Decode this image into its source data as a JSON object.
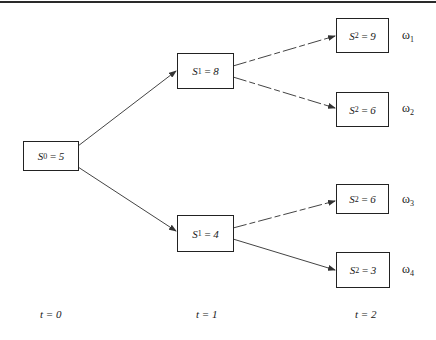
{
  "diagram": {
    "type": "binomial-tree",
    "nodes": [
      {
        "id": "s0",
        "var": "S",
        "sub": "0",
        "eq": " = ",
        "value": "5"
      },
      {
        "id": "s1_up",
        "var": "S",
        "sub": "1",
        "eq": " = ",
        "value": "8"
      },
      {
        "id": "s1_dn",
        "var": "S",
        "sub": "1",
        "eq": " = ",
        "value": "4"
      },
      {
        "id": "s2_uu",
        "var": "S",
        "sub": "2",
        "eq": " = ",
        "value": "9"
      },
      {
        "id": "s2_ud",
        "var": "S",
        "sub": "2",
        "eq": " = ",
        "value": "6"
      },
      {
        "id": "s2_du",
        "var": "S",
        "sub": "2",
        "eq": " = ",
        "value": "6"
      },
      {
        "id": "s2_dd",
        "var": "S",
        "sub": "2",
        "eq": " = ",
        "value": "3"
      }
    ],
    "edges": [
      {
        "from": "s0",
        "to": "s1_up"
      },
      {
        "from": "s0",
        "to": "s1_dn"
      },
      {
        "from": "s1_up",
        "to": "s2_uu"
      },
      {
        "from": "s1_up",
        "to": "s2_ud"
      },
      {
        "from": "s1_dn",
        "to": "s2_du"
      },
      {
        "from": "s1_dn",
        "to": "s2_dd"
      }
    ],
    "outcomes": [
      {
        "symbol": "ω",
        "sub": "1"
      },
      {
        "symbol": "ω",
        "sub": "2"
      },
      {
        "symbol": "ω",
        "sub": "3"
      },
      {
        "symbol": "ω",
        "sub": "4"
      }
    ],
    "time_labels": [
      "t = 0",
      "t = 1",
      "t = 2"
    ]
  }
}
